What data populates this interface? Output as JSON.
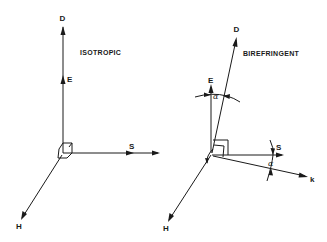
{
  "panels": [
    {
      "title": "ISOTROPIC",
      "vectors": {
        "D": "D",
        "E": "E",
        "S": "S",
        "k": "k",
        "H": "H"
      }
    },
    {
      "title": "BIREFRINGENT",
      "vectors": {
        "D": "D",
        "E": "E",
        "S": "S",
        "k": "k",
        "H": "H"
      },
      "angles": {
        "E_D": "α",
        "S_k": "α"
      }
    }
  ],
  "colors": {
    "ink": "#1a1a1a",
    "background": "#ffffff"
  }
}
